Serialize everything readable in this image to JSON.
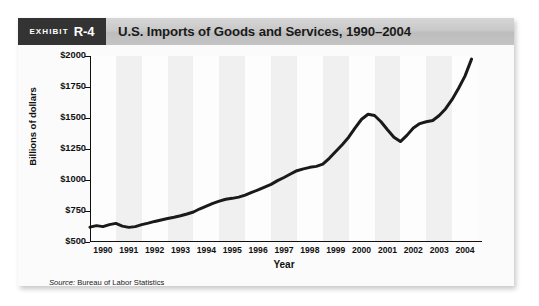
{
  "exhibit": {
    "tag_word": "Exhibit",
    "tag_number": "R-4",
    "title": "U.S. Imports of Goods and Services, 1990–2004"
  },
  "source": {
    "label": "Source:",
    "text": "Bureau of Labor Statistics"
  },
  "chart_data": {
    "type": "line",
    "title": "U.S. Imports of Goods and Services, 1990–2004",
    "xlabel": "Year",
    "ylabel": "Billions of dollars",
    "xlim": [
      1990,
      2005
    ],
    "ylim": [
      500,
      2000
    ],
    "ytick_values": [
      500,
      750,
      1000,
      1250,
      1500,
      1750,
      2000
    ],
    "ytick_labels": [
      "$500",
      "$750",
      "$1000",
      "$1250",
      "$1500",
      "$1750",
      "$2000"
    ],
    "xtick_labels": [
      "1990",
      "1991",
      "1992",
      "1993",
      "1994",
      "1995",
      "1996",
      "1997",
      "1998",
      "1999",
      "2000",
      "2001",
      "2002",
      "2003",
      "2004"
    ],
    "grid": false,
    "legend": null,
    "line_color": "#1a1a1a",
    "line_width": 3.0,
    "series": [
      {
        "name": "U.S. Imports of Goods and Services",
        "units": "Billions of dollars",
        "x": [
          1990.0,
          1990.25,
          1990.5,
          1990.75,
          1991.0,
          1991.25,
          1991.5,
          1991.75,
          1992.0,
          1992.25,
          1992.5,
          1992.75,
          1993.0,
          1993.25,
          1993.5,
          1993.75,
          1994.0,
          1994.25,
          1994.5,
          1994.75,
          1995.0,
          1995.25,
          1995.5,
          1995.75,
          1996.0,
          1996.25,
          1996.5,
          1996.75,
          1997.0,
          1997.25,
          1997.5,
          1997.75,
          1998.0,
          1998.25,
          1998.5,
          1998.75,
          1999.0,
          1999.25,
          1999.5,
          1999.75,
          2000.0,
          2000.25,
          2000.5,
          2000.75,
          2001.0,
          2001.25,
          2001.5,
          2001.75,
          2002.0,
          2002.25,
          2002.5,
          2002.75,
          2003.0,
          2003.25,
          2003.5,
          2003.75,
          2004.0,
          2004.25,
          2004.5,
          2004.75
        ],
        "values": [
          620,
          632,
          624,
          640,
          650,
          628,
          618,
          624,
          640,
          652,
          666,
          678,
          690,
          700,
          712,
          726,
          742,
          768,
          790,
          812,
          830,
          845,
          852,
          862,
          878,
          900,
          920,
          942,
          965,
          995,
          1020,
          1048,
          1075,
          1090,
          1102,
          1110,
          1128,
          1175,
          1230,
          1285,
          1345,
          1420,
          1490,
          1530,
          1520,
          1470,
          1405,
          1345,
          1310,
          1360,
          1420,
          1455,
          1470,
          1480,
          1520,
          1575,
          1650,
          1740,
          1840,
          1975
        ]
      }
    ],
    "annotations": []
  }
}
